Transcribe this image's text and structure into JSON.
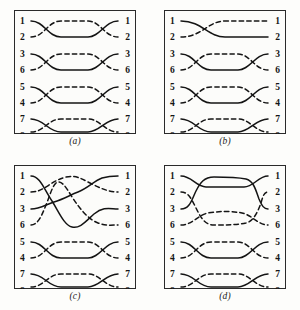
{
  "figure": {
    "terminal_count": 8,
    "panels": [
      {
        "id": "a",
        "caption": "(a)",
        "left_labels": [
          "1",
          "2",
          "3",
          "6",
          "5",
          "4",
          "7",
          "8"
        ],
        "right_labels": [
          "1",
          "2",
          "3",
          "6",
          "5",
          "4",
          "7",
          "8"
        ],
        "description": "four independent lens crossings on terminal pairs (1,2) (3,6) (5,4) (7,8)"
      },
      {
        "id": "b",
        "caption": "(b)",
        "left_labels": [
          "1",
          "2",
          "3",
          "6",
          "5",
          "4",
          "7",
          "8"
        ],
        "right_labels": [
          "1",
          "2",
          "3",
          "6",
          "5",
          "4",
          "7",
          "8"
        ],
        "description": "single crossing on pair (1,2); lens crossings on pairs (3,6) (5,4) (7,8)"
      },
      {
        "id": "c",
        "caption": "(c)",
        "left_labels": [
          "1",
          "2",
          "3",
          "6",
          "5",
          "4",
          "7",
          "8"
        ],
        "right_labels": [
          "1",
          "2",
          "3",
          "6",
          "5",
          "4",
          "7",
          "8"
        ],
        "description": "tangled four-strand braid across terminals 1,2,3,6; lens crossings on pairs (5,4) (7,8)"
      },
      {
        "id": "d",
        "caption": "(d)",
        "left_labels": [
          "1",
          "2",
          "3",
          "6",
          "5",
          "4",
          "7",
          "8"
        ],
        "right_labels": [
          "1",
          "2",
          "3",
          "6",
          "5",
          "4",
          "7",
          "8"
        ],
        "description": "solid lens between terminals 1 and 3 nested over dashed lens between terminals 2 and 6; lens crossings on pairs (5,4) (7,8)"
      }
    ]
  }
}
